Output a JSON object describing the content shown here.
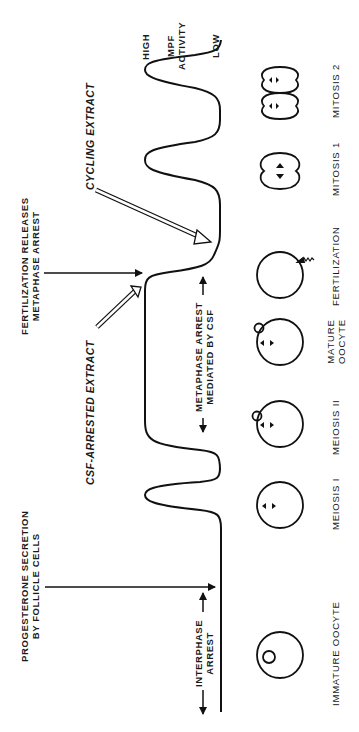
{
  "figure": {
    "orientation": "rotated 90° counter-clockwise",
    "axis_label": {
      "high": "HIGH",
      "title_line1": "MPF",
      "title_line2": "ACTIVITY",
      "low": "LOW"
    },
    "events": {
      "progesterone": {
        "line1": "PROGESTERONE SECRETION",
        "line2": "BY FOLLICLE CELLS"
      },
      "fertilization": {
        "line1": "FERTILIZATION RELEASES",
        "line2": "METAPHASE ARREST"
      }
    },
    "extracts": {
      "csf": "CSF-ARRESTED EXTRACT",
      "cycling": "CYCLING EXTRACT"
    },
    "arrests": {
      "interphase": {
        "line1": "INTERPHASE",
        "line2": "ARREST"
      },
      "metaphase": {
        "line1": "METAPHASE ARREST",
        "line2": "MEDIATED BY CSF"
      }
    },
    "stages": [
      {
        "label": "IMMATURE OOCYTE"
      },
      {
        "label": "MEIOSIS I"
      },
      {
        "label": "MEIOSIS II"
      },
      {
        "label_line1": "MATURE",
        "label_line2": "OOCYTE"
      },
      {
        "label": "FERTILIZATION"
      },
      {
        "label": "MITOSIS 1"
      },
      {
        "label": "MITOSIS 2"
      }
    ]
  }
}
